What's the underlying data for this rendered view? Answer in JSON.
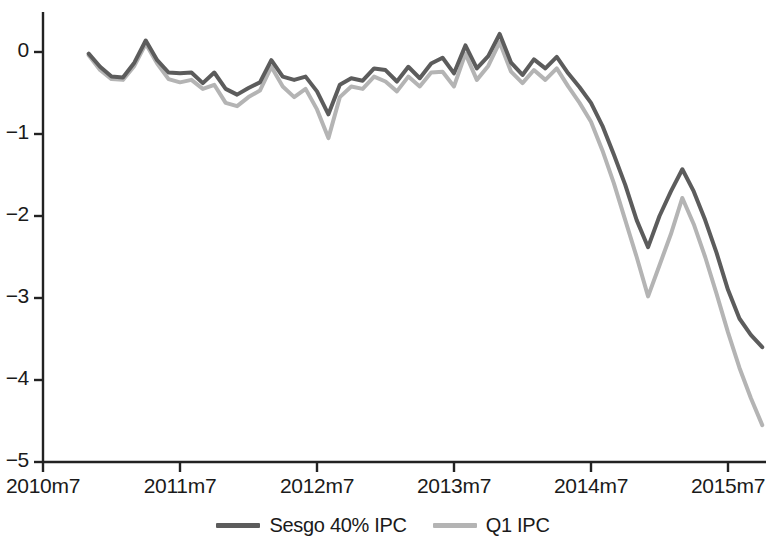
{
  "chart_data": {
    "type": "line",
    "title": "",
    "xlabel": "",
    "ylabel": "",
    "grid": false,
    "legend_position": "bottom-center",
    "xlim": [
      "2010m7",
      "2015m12"
    ],
    "ylim": [
      -5,
      0.5
    ],
    "y_ticks": [
      "0",
      "-1",
      "-2",
      "-3",
      "-4",
      "-5"
    ],
    "y_tick_values": [
      0,
      -1,
      -2,
      -3,
      -4,
      -5
    ],
    "x_ticks": [
      "2010m7",
      "2011m7",
      "2012m7",
      "2013m7",
      "2014m7",
      "2015m7"
    ],
    "x_tick_months": [
      "2010m7",
      "2011m7",
      "2012m7",
      "2013m7",
      "2014m7",
      "2015m7"
    ],
    "x": [
      "2010m11",
      "2010m12",
      "2011m1",
      "2011m2",
      "2011m3",
      "2011m4",
      "2011m5",
      "2011m6",
      "2011m7",
      "2011m8",
      "2011m9",
      "2011m10",
      "2011m11",
      "2011m12",
      "2012m1",
      "2012m2",
      "2012m3",
      "2012m4",
      "2012m5",
      "2012m6",
      "2012m7",
      "2012m8",
      "2012m9",
      "2012m10",
      "2012m11",
      "2012m12",
      "2013m1",
      "2013m2",
      "2013m3",
      "2013m4",
      "2013m5",
      "2013m6",
      "2013m7",
      "2013m8",
      "2013m9",
      "2013m10",
      "2013m11",
      "2013m12",
      "2014m1",
      "2014m2",
      "2014m3",
      "2014m4",
      "2014m5",
      "2014m6",
      "2014m7",
      "2014m8",
      "2014m9",
      "2014m10",
      "2014m11",
      "2014m12",
      "2015m1",
      "2015m2",
      "2015m3",
      "2015m4",
      "2015m5",
      "2015m6",
      "2015m7",
      "2015m8",
      "2015m9",
      "2015m10"
    ],
    "series": [
      {
        "name": "Sesgo 40% IPC",
        "color": "#5c5c5c",
        "width": 4,
        "values": [
          -0.02,
          -0.18,
          -0.3,
          -0.31,
          -0.13,
          0.14,
          -0.1,
          -0.25,
          -0.26,
          -0.25,
          -0.38,
          -0.25,
          -0.45,
          -0.52,
          -0.44,
          -0.37,
          -0.1,
          -0.3,
          -0.34,
          -0.3,
          -0.48,
          -0.76,
          -0.4,
          -0.32,
          -0.35,
          -0.2,
          -0.22,
          -0.36,
          -0.18,
          -0.32,
          -0.14,
          -0.07,
          -0.26,
          0.08,
          -0.2,
          -0.05,
          0.22,
          -0.13,
          -0.28,
          -0.09,
          -0.2,
          -0.06,
          -0.26,
          -0.43,
          -0.62,
          -0.9,
          -1.25,
          -1.62,
          -2.05,
          -2.38,
          -2.0,
          -1.7,
          -1.43,
          -1.7,
          -2.05,
          -2.45,
          -2.9,
          -3.25,
          -3.45,
          -3.6
        ]
      },
      {
        "name": "Q1 IPC",
        "color": "#b4b4b4",
        "width": 4,
        "values": [
          -0.04,
          -0.22,
          -0.33,
          -0.34,
          -0.17,
          0.1,
          -0.14,
          -0.33,
          -0.37,
          -0.34,
          -0.45,
          -0.4,
          -0.62,
          -0.66,
          -0.55,
          -0.47,
          -0.18,
          -0.42,
          -0.55,
          -0.45,
          -0.7,
          -1.05,
          -0.55,
          -0.42,
          -0.45,
          -0.3,
          -0.36,
          -0.48,
          -0.3,
          -0.42,
          -0.25,
          -0.24,
          -0.42,
          -0.02,
          -0.34,
          -0.17,
          0.12,
          -0.24,
          -0.38,
          -0.22,
          -0.34,
          -0.2,
          -0.42,
          -0.62,
          -0.85,
          -1.2,
          -1.6,
          -2.05,
          -2.5,
          -2.98,
          -2.6,
          -2.22,
          -1.78,
          -2.1,
          -2.5,
          -2.95,
          -3.42,
          -3.85,
          -4.22,
          -4.55
        ]
      }
    ]
  },
  "axes": {
    "y_tick_labels": [
      "0",
      "−1",
      "−2",
      "−3",
      "−4",
      "−5"
    ],
    "x_tick_labels": [
      "2010m7",
      "2011m7",
      "2012m7",
      "2013m7",
      "2014m7",
      "2015m7"
    ],
    "axis_color": "#222222"
  },
  "legend": {
    "items": [
      {
        "label": "Sesgo 40% IPC",
        "color": "#5c5c5c"
      },
      {
        "label": "Q1 IPC",
        "color": "#b4b4b4"
      }
    ]
  }
}
